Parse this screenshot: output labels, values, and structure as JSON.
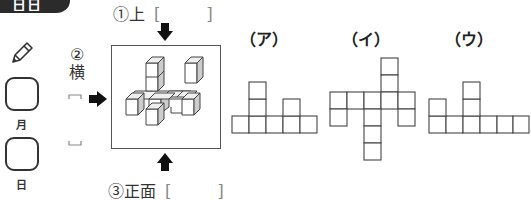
{
  "header_tab": {
    "text": "日日"
  },
  "date": {
    "month_label": "月",
    "day_label": "日",
    "icons": [
      "pencil-icon"
    ]
  },
  "questions": {
    "top": {
      "number": "①",
      "label": "上",
      "open": "[",
      "close": "]"
    },
    "side": {
      "number": "②",
      "label": "横",
      "open": "⌐",
      "close": "⌙"
    },
    "front": {
      "number": "③",
      "label": "正面",
      "open": "[",
      "close": "]"
    }
  },
  "options": [
    {
      "label": "（ア）",
      "cells": [
        [
          0,
          2
        ],
        [
          1,
          0
        ],
        [
          1,
          1
        ],
        [
          1,
          2
        ],
        [
          1,
          3
        ],
        [
          1,
          4
        ],
        [
          0,
          1
        ],
        [
          0,
          3
        ],
        [
          2,
          1
        ]
      ]
    },
    {
      "label": "（イ）"
    },
    {
      "label": "（ウ）"
    }
  ],
  "colors": {
    "ink": "#222222",
    "tab": "#2b2b2b",
    "frame": "#555555"
  }
}
